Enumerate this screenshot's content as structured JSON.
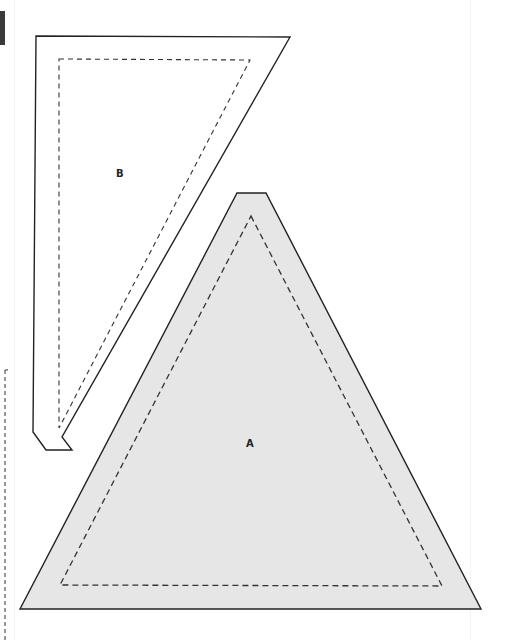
{
  "diagram": {
    "type": "sewing-pattern-pieces",
    "colors": {
      "outline": "#222222",
      "dashed": "#333333",
      "fill_a": "#e6e6e6",
      "fill_b": "#ffffff",
      "edge_block": "#3a3a3a"
    },
    "pieces": [
      {
        "id": "B",
        "label": "B",
        "outline_points": "36,36 290,37 62,437 72,450 46,450 33,432",
        "seam_points": "59,59 250,60 59,428"
      },
      {
        "id": "A",
        "label": "A",
        "outline_points": "237,193 266,193 481,609 20,609",
        "seam_points": "251,216 442,586 60,585"
      }
    ],
    "edge_guides": {
      "left_dashed_x": 5,
      "left_dashed_top": 370,
      "left_dashed_bottom": 640
    }
  }
}
